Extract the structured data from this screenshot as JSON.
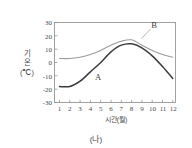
{
  "figure": {
    "caption": "(나)"
  },
  "chart_data": {
    "type": "line",
    "title": "",
    "xlabel": "시간(월)",
    "ylabel_lines": [
      "기",
      "온",
      "(℃)"
    ],
    "ylabel": "기온(℃)",
    "x": [
      1,
      2,
      3,
      4,
      5,
      6,
      7,
      8,
      9,
      10,
      11,
      12
    ],
    "xtick_labels": [
      "1",
      "2",
      "3",
      "4",
      "5",
      "6",
      "7",
      "8",
      "9",
      "10",
      "11",
      "12"
    ],
    "ytick_labels": [
      "30",
      "20",
      "10",
      "0",
      "-10",
      "-20",
      "-30"
    ],
    "yticks": [
      30,
      20,
      10,
      0,
      -10,
      -20,
      -30
    ],
    "xlim": [
      0.6,
      12.4
    ],
    "ylim": [
      -30,
      30
    ],
    "grid": false,
    "legend_position": "inline-annotations",
    "series": [
      {
        "name": "A",
        "label": "A",
        "color": "#3c3c3c",
        "values": [
          -18,
          -18,
          -14,
          -7,
          0,
          8,
          13,
          14,
          11,
          5,
          -3,
          -12
        ]
      },
      {
        "name": "B",
        "label": "B",
        "color": "#9a9a9a",
        "values": [
          3,
          3,
          4,
          6,
          9,
          13,
          16,
          17,
          13,
          9,
          6,
          4
        ]
      }
    ],
    "annotations": [
      {
        "text": "A",
        "x": 5.2,
        "y": -7
      },
      {
        "text": "B",
        "x": 10.4,
        "y": 22
      }
    ]
  }
}
